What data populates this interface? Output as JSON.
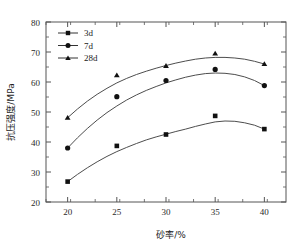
{
  "chart_data": {
    "type": "line",
    "title": "",
    "xlabel": "砂率/%",
    "ylabel": "抗压强度/MPa",
    "x": [
      20,
      25,
      30,
      35,
      40
    ],
    "xticklabels": [
      "20",
      "25",
      "30",
      "35",
      "40"
    ],
    "yticklabels": [
      "20",
      "30",
      "40",
      "50",
      "60",
      "70",
      "80"
    ],
    "xlim": [
      17.8,
      42.2
    ],
    "ylim": [
      20,
      80
    ],
    "xtick_step": 5,
    "ytick_step": 10,
    "yminor_step": 5,
    "grid": false,
    "legend_position": "upper-left-inside",
    "series": [
      {
        "name": "3d",
        "marker": "square",
        "color": "#111111",
        "values": [
          26.8,
          38.7,
          42.5,
          48.7,
          44.3
        ],
        "fit": [
          [
            20,
            26.8
          ],
          [
            21,
            29.2
          ],
          [
            22,
            31.4
          ],
          [
            23,
            33.4
          ],
          [
            24,
            35.2
          ],
          [
            25,
            36.8
          ],
          [
            26,
            38.2
          ],
          [
            27,
            39.5
          ],
          [
            28,
            40.7
          ],
          [
            29,
            41.7
          ],
          [
            30,
            42.6
          ],
          [
            31,
            43.5
          ],
          [
            32,
            44.3
          ],
          [
            33,
            45.2
          ],
          [
            34,
            46.0
          ],
          [
            35,
            46.7
          ],
          [
            36,
            47.0
          ],
          [
            37,
            46.9
          ],
          [
            38,
            46.4
          ],
          [
            39,
            45.6
          ],
          [
            40,
            44.3
          ]
        ]
      },
      {
        "name": "7d",
        "marker": "circle",
        "color": "#111111",
        "values": [
          38.0,
          55.1,
          60.5,
          64.2,
          58.8
        ],
        "fit": [
          [
            20,
            38.0
          ],
          [
            21,
            41.4
          ],
          [
            22,
            44.5
          ],
          [
            23,
            47.3
          ],
          [
            24,
            49.8
          ],
          [
            25,
            52.0
          ],
          [
            26,
            54.0
          ],
          [
            27,
            55.7
          ],
          [
            28,
            57.2
          ],
          [
            29,
            58.5
          ],
          [
            30,
            59.7
          ],
          [
            31,
            60.7
          ],
          [
            32,
            61.6
          ],
          [
            33,
            62.3
          ],
          [
            34,
            62.8
          ],
          [
            35,
            63.0
          ],
          [
            36,
            62.9
          ],
          [
            37,
            62.5
          ],
          [
            38,
            61.7
          ],
          [
            39,
            60.5
          ],
          [
            40,
            58.8
          ]
        ]
      },
      {
        "name": "28d",
        "marker": "triangle",
        "color": "#111111",
        "values": [
          48.1,
          62.3,
          65.4,
          69.5,
          66.0
        ],
        "fit": [
          [
            20,
            48.1
          ],
          [
            21,
            51.0
          ],
          [
            22,
            53.6
          ],
          [
            23,
            55.9
          ],
          [
            24,
            57.9
          ],
          [
            25,
            59.7
          ],
          [
            26,
            61.2
          ],
          [
            27,
            62.5
          ],
          [
            28,
            63.6
          ],
          [
            29,
            64.6
          ],
          [
            30,
            65.5
          ],
          [
            31,
            66.3
          ],
          [
            32,
            67.0
          ],
          [
            33,
            67.6
          ],
          [
            34,
            68.0
          ],
          [
            35,
            68.2
          ],
          [
            36,
            68.2
          ],
          [
            37,
            68.0
          ],
          [
            38,
            67.6
          ],
          [
            39,
            66.9
          ],
          [
            40,
            66.0
          ]
        ]
      }
    ]
  },
  "legend": {
    "items": [
      {
        "label": "3d"
      },
      {
        "label": "7d"
      },
      {
        "label": "28d"
      }
    ]
  }
}
